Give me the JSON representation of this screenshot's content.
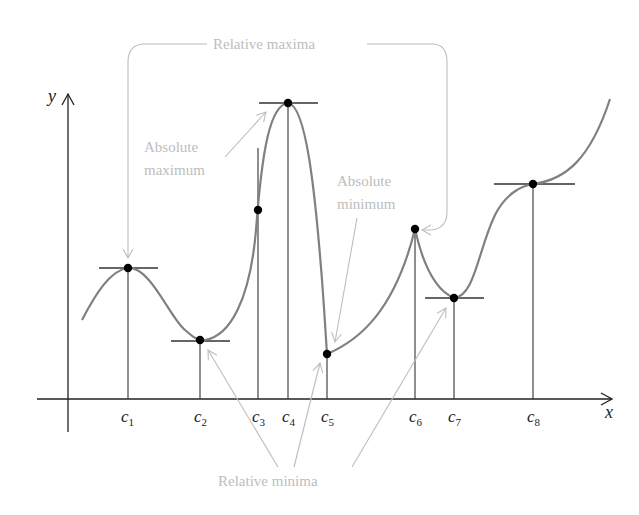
{
  "diagram": {
    "axes": {
      "x_label": "x",
      "y_label": "y"
    },
    "critical_points": [
      {
        "id": "c1",
        "label": "c",
        "sub": "1",
        "type": "relative maximum (horizontal tangent)"
      },
      {
        "id": "c2",
        "label": "c",
        "sub": "2",
        "type": "relative minimum (horizontal tangent)"
      },
      {
        "id": "c3",
        "label": "c",
        "sub": "3",
        "type": "vertical tangent (not extremum)"
      },
      {
        "id": "c4",
        "label": "c",
        "sub": "4",
        "type": "absolute maximum (horizontal tangent)"
      },
      {
        "id": "c5",
        "label": "c",
        "sub": "5",
        "type": "absolute minimum / endpoint of jump"
      },
      {
        "id": "c6",
        "label": "c",
        "sub": "6",
        "type": "relative maximum (cusp)"
      },
      {
        "id": "c7",
        "label": "c",
        "sub": "7",
        "type": "relative minimum (horizontal tangent)"
      },
      {
        "id": "c8",
        "label": "c",
        "sub": "8",
        "type": "horizontal tangent, inflection (not extremum)"
      }
    ],
    "annotations": {
      "relative_maxima": "Relative maxima",
      "absolute_maximum_line1": "Absolute",
      "absolute_maximum_line2": "maximum",
      "absolute_minimum_line1": "Absolute",
      "absolute_minimum_line2": "minimum",
      "relative_minima": "Relative minima"
    },
    "colors": {
      "curve": "#808080",
      "axes": "#222222",
      "annotation": "#bdbdbd",
      "points": "#000000"
    }
  }
}
